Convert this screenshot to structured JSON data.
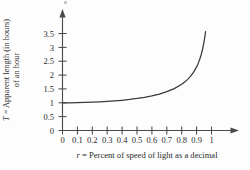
{
  "figure": {
    "background_color": "#fdfdfd",
    "axis_color": "#4a4a4a",
    "curve_color": "#3a3a3a"
  },
  "axis_titles": {
    "y_symbol": "T",
    "y_line_one": " = Apparent length (in hours)",
    "y_line_two": "of an hour",
    "x_symbol": "r",
    "x_rest": " = Percent of speed of light as a decimal"
  },
  "chart_data": {
    "type": "line",
    "title": "",
    "xlabel": "r = Percent of speed of light as a decimal",
    "ylabel": "T = Apparent length (in hours) of an hour",
    "xlim": [
      0,
      1.06
    ],
    "ylim": [
      0,
      3.6
    ],
    "grid": false,
    "legend": false,
    "x_ticks": [
      "0",
      "0.1",
      "0.2",
      "0.3",
      "0.4",
      "0.5",
      "0.6",
      "0.7",
      "0.8",
      "0.9",
      "1"
    ],
    "x_tick_values": [
      0,
      0.1,
      0.2,
      0.3,
      0.4,
      0.5,
      0.6,
      0.7,
      0.8,
      0.9,
      1
    ],
    "y_ticks": [
      "0",
      "0.5",
      "1",
      "1.5",
      "2",
      "2.5",
      "3",
      "3.5"
    ],
    "y_tick_values": [
      0,
      0.5,
      1,
      1.5,
      2,
      2.5,
      3,
      3.5
    ],
    "series": [
      {
        "name": "T = 1 / sqrt(1 - r^2)",
        "x": [
          0,
          0.05,
          0.1,
          0.15,
          0.2,
          0.25,
          0.3,
          0.35,
          0.4,
          0.45,
          0.5,
          0.55,
          0.6,
          0.65,
          0.7,
          0.75,
          0.8,
          0.82,
          0.84,
          0.86,
          0.88,
          0.9,
          0.91,
          0.92,
          0.93,
          0.94,
          0.945,
          0.95,
          0.955,
          0.96
        ],
        "y": [
          1.0,
          1.001,
          1.005,
          1.011,
          1.021,
          1.033,
          1.048,
          1.068,
          1.091,
          1.12,
          1.155,
          1.198,
          1.25,
          1.316,
          1.4,
          1.512,
          1.667,
          1.75,
          1.845,
          1.96,
          2.105,
          2.294,
          2.412,
          2.552,
          2.723,
          2.932,
          3.058,
          3.203,
          3.371,
          3.571
        ]
      }
    ]
  }
}
